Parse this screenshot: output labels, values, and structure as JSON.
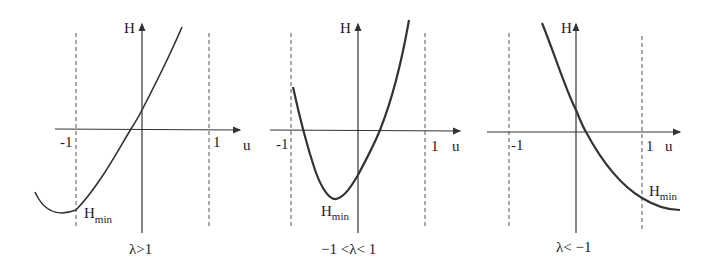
{
  "panels": [
    {
      "id": "p1",
      "caption": "λ>1",
      "y_label": "H",
      "x_label": "u",
      "tick_neg": "-1",
      "tick_pos": "1",
      "min_label": "H",
      "min_sub": "min"
    },
    {
      "id": "p2",
      "caption": "−1 <λ< 1",
      "y_label": "H",
      "x_label": "u",
      "tick_neg": "-1",
      "tick_pos": "1",
      "min_label": "H",
      "min_sub": "min"
    },
    {
      "id": "p3",
      "caption": "λ< −1",
      "y_label": "H",
      "x_label": "u",
      "tick_neg": "-1",
      "tick_pos": "1",
      "min_label": "H",
      "min_sub": "min"
    }
  ]
}
